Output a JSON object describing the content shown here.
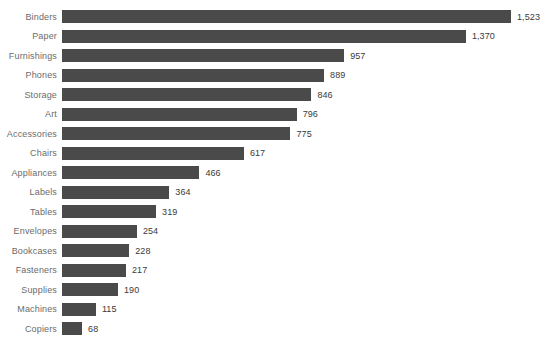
{
  "chart_data": {
    "type": "bar",
    "orientation": "horizontal",
    "title": "",
    "xlabel": "",
    "ylabel": "",
    "grid": false,
    "legend": false,
    "xlim": [
      0,
      1523
    ],
    "categories": [
      "Binders",
      "Paper",
      "Furnishings",
      "Phones",
      "Storage",
      "Art",
      "Accessories",
      "Chairs",
      "Appliances",
      "Labels",
      "Tables",
      "Envelopes",
      "Bookcases",
      "Fasteners",
      "Supplies",
      "Machines",
      "Copiers"
    ],
    "values": [
      1523,
      1370,
      957,
      889,
      846,
      796,
      775,
      617,
      466,
      364,
      319,
      254,
      228,
      217,
      190,
      115,
      68
    ],
    "value_labels": [
      "1,523",
      "1,370",
      "957",
      "889",
      "846",
      "796",
      "775",
      "617",
      "466",
      "364",
      "319",
      "254",
      "228",
      "217",
      "190",
      "115",
      "68"
    ],
    "bar_color": "#4a4a4a",
    "label_color": "#6b6b6b",
    "value_color": "#3a3a3a",
    "background_color": "#ffffff"
  }
}
